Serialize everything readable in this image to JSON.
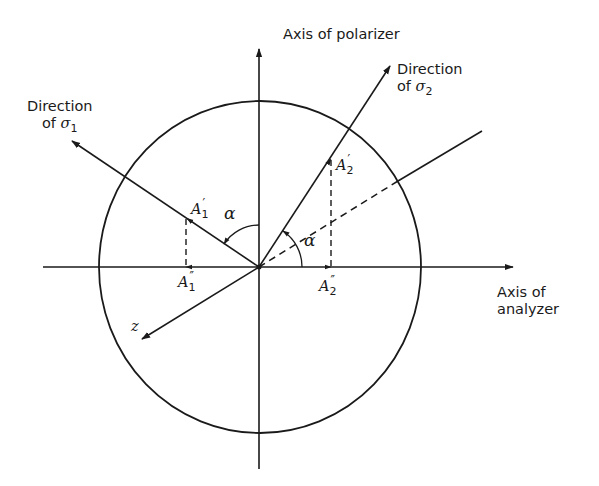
{
  "figure": {
    "labels": {
      "polarizer_axis": "Axis of polarizer",
      "analyzer_axis_line1": "Axis of",
      "analyzer_axis_line2": "analyzer",
      "sigma1_line1": "Direction",
      "sigma1_line2_prefix": "of ",
      "sigma1_symbol": "σ",
      "sigma1_sub": "1",
      "sigma2_line1": "Direction",
      "sigma2_line2_prefix": "of ",
      "sigma2_symbol": "σ",
      "sigma2_sub": "2",
      "A1_prime": "A",
      "A1_prime_sub": "1",
      "A1_prime_mark": "′",
      "A1_dprime": "A",
      "A1_dprime_sub": "1",
      "A1_dprime_mark": "″",
      "A2_prime": "A",
      "A2_prime_sub": "2",
      "A2_prime_mark": "′",
      "A2_dprime": "A",
      "A2_dprime_sub": "2",
      "A2_dprime_mark": "″",
      "alpha_left": "α",
      "alpha_right": "α",
      "z_axis": "z"
    },
    "colors": {
      "stroke": "#1a1a1a",
      "background": "#ffffff"
    }
  }
}
